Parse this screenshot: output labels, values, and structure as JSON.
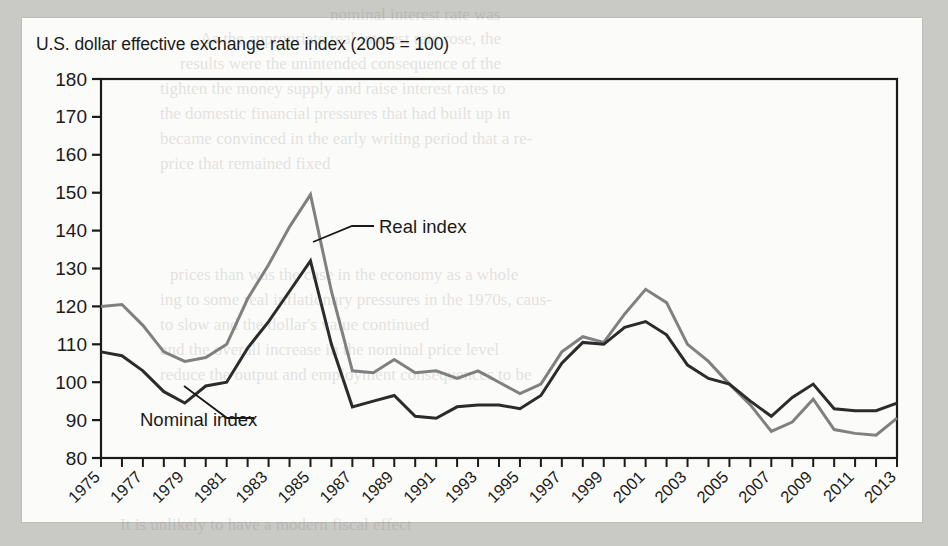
{
  "page": {
    "background_color": "#c9c9c6",
    "panel_color": "#fbfbf9"
  },
  "figure": {
    "title": "U.S. dollar effective exchange rate index (2005 = 100)"
  },
  "annotations": {
    "real_label": "Real index",
    "nominal_label": "Nominal index"
  },
  "ghost_text": {
    "lines": [
      "nominal interest rate was",
      "As the appropriate real interest rate rose, the",
      "results were the unintended consequence of the",
      "tighten the money supply and raise interest rates to",
      "the domestic financial pressures that had built up in",
      "became convinced in the early writing period that a re-",
      "price that remained fixed",
      "prices than was the case in the economy as a whole",
      "ing to some real inflationary pressures in the 1970s, caus-",
      "to slow and the dollar's value continued",
      "and the overall increase in the nominal price level",
      "reduce the output and employment consequences to be",
      "It is unlikely to have a modern fiscal effect"
    ]
  },
  "chart_data": {
    "type": "line",
    "title": "U.S. dollar effective exchange rate index (2005 = 100)",
    "xlabel": "",
    "ylabel": "",
    "xlim": [
      1975,
      2013
    ],
    "ylim": [
      80,
      180
    ],
    "ytick_step": 10,
    "ytick_labels": [
      "180",
      "170",
      "160",
      "150",
      "140",
      "130",
      "120",
      "110",
      "100",
      "90",
      "80"
    ],
    "yticks": [
      180,
      170,
      160,
      150,
      140,
      130,
      120,
      110,
      100,
      90,
      80
    ],
    "xtick_labels": [
      "1975",
      "1977",
      "1979",
      "1981",
      "1983",
      "1985",
      "1987",
      "1989",
      "1991",
      "1993",
      "1995",
      "1997",
      "1999",
      "2001",
      "2003",
      "2005",
      "2007",
      "2009",
      "2011",
      "2013"
    ],
    "xticks": [
      1975,
      1977,
      1979,
      1981,
      1983,
      1985,
      1987,
      1989,
      1991,
      1993,
      1995,
      1997,
      1999,
      2001,
      2003,
      2005,
      2007,
      2009,
      2011,
      2013
    ],
    "xtick_minor_every": 1,
    "xtick_label_rotation": -45,
    "grid": false,
    "legend_position": "inline-annotation",
    "x": [
      1975,
      1976,
      1977,
      1978,
      1979,
      1980,
      1981,
      1982,
      1983,
      1984,
      1985,
      1986,
      1987,
      1988,
      1989,
      1990,
      1991,
      1992,
      1993,
      1994,
      1995,
      1996,
      1997,
      1998,
      1999,
      2000,
      2001,
      2002,
      2003,
      2004,
      2005,
      2006,
      2007,
      2008,
      2009,
      2010,
      2011,
      2012,
      2013
    ],
    "series": [
      {
        "name": "Real index",
        "color": "#808080",
        "values": [
          120,
          120.5,
          115,
          108,
          105.5,
          106.5,
          110,
          122,
          131,
          141,
          149.5,
          124,
          103,
          102.5,
          106,
          102.5,
          103,
          101,
          103,
          100,
          97,
          99.5,
          108,
          112,
          110.5,
          118,
          124.5,
          121,
          110,
          105.5,
          99.5,
          94,
          87,
          89.5,
          95.5,
          87.5,
          86.5,
          86,
          90.5
        ]
      },
      {
        "name": "Nominal index",
        "color": "#2b2b2b",
        "values": [
          108,
          107,
          103,
          97.5,
          94.5,
          99,
          100,
          109,
          116,
          124,
          132,
          110,
          93.5,
          95,
          96.5,
          91,
          90.5,
          93.5,
          94,
          94,
          93,
          96.5,
          105,
          110.5,
          110,
          114.5,
          116,
          112.5,
          104.5,
          101,
          99.5,
          95,
          91,
          96,
          99.5,
          93,
          92.5,
          92.5,
          94.5
        ]
      }
    ]
  }
}
